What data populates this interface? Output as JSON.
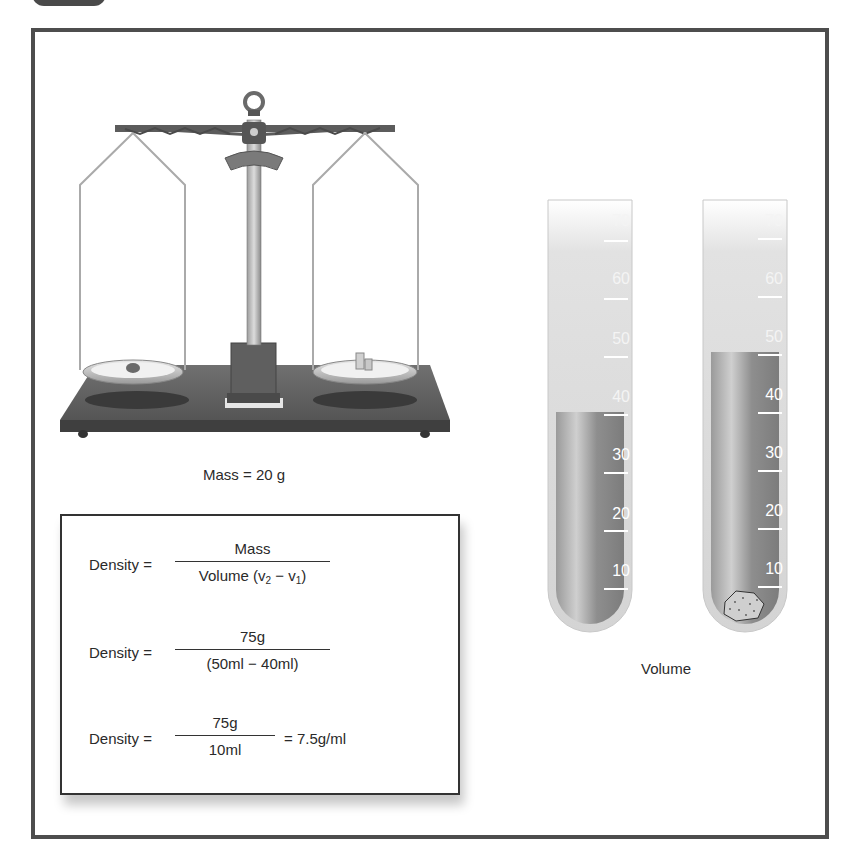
{
  "diagram": {
    "balance": {
      "caption": "Mass = 20 g",
      "left_pan_contents": "rock-sample",
      "right_pan_contents": "weights"
    },
    "formula_box": {
      "rows": [
        {
          "lhs": "Density =",
          "numerator": "Mass",
          "denominator_prefix": "Volume (v",
          "sub2": "2",
          "minus": " − v",
          "sub1": "1",
          "denominator_suffix": ")",
          "rhs": ""
        },
        {
          "lhs": "Density =",
          "numerator": "75g",
          "denominator": "(50ml − 40ml)",
          "rhs": ""
        },
        {
          "lhs": "Density =",
          "numerator": "75g",
          "denominator": "10ml",
          "rhs": "= 7.5g/ml"
        }
      ]
    },
    "cylinders": {
      "caption": "Volume",
      "left": {
        "level_ml": 40,
        "scale": [
          "70",
          "60",
          "50",
          "40",
          "30",
          "20",
          "10"
        ]
      },
      "right": {
        "level_ml": 50,
        "scale": [
          "70",
          "60",
          "50",
          "40",
          "30",
          "20",
          "10"
        ],
        "contents": "rock-sample"
      }
    },
    "colors": {
      "frame": "#4d4d4d",
      "liquid": "#8a8a8a",
      "base": "#5a5a5a"
    }
  }
}
